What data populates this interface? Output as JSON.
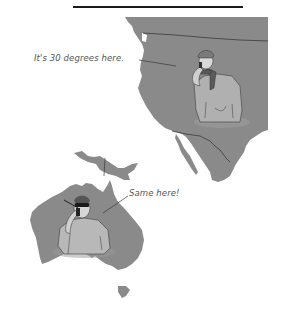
{
  "illustration": {
    "top_rule": true,
    "regions": [
      {
        "name": "North America (western US and Mexico)",
        "figure": "man in winter coat, knit hat and scarf, talking on phone",
        "callout": "It's 30 degrees here."
      },
      {
        "name": "Australia (with New Guinea and Tasmania)",
        "figure": "man in t-shirt and sunglasses, talking on phone",
        "callout": "Same here!"
      }
    ]
  },
  "colors": {
    "land": "#8a8a8a",
    "border_lines": "#3a3a3a",
    "figure_fill": "#b5b5b5",
    "text": "#555555",
    "rule": "#1a1a1a"
  }
}
